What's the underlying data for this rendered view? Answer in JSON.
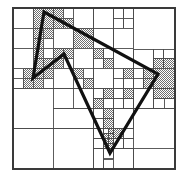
{
  "figure": {
    "name": "quadtree-polygon-decomposition",
    "title": "",
    "caption": "",
    "width": 188,
    "height": 179,
    "background_color": "#ffffff"
  },
  "frame": {
    "x": 13,
    "y": 8,
    "width": 162,
    "height": 161,
    "stroke_color": "#3a3a3a",
    "stroke_width": 1.2,
    "fill_color": "#ffffff"
  },
  "style": {
    "grid_line_color": "#4a4a4a",
    "grid_line_width": 0.9,
    "shaded_cell_color": "#b4b4b4",
    "shaded_cell_pattern": "checker-dither",
    "empty_cell_color": "#ffffff",
    "polygon_stroke_color": "#111111",
    "polygon_stroke_width": 3.2,
    "polygon_fill": "none"
  },
  "polygon": {
    "name": "input-polygon",
    "closed": true,
    "vertex_count": 5,
    "vertices": [
      {
        "label": "top",
        "x": 44,
        "y": 12
      },
      {
        "label": "right",
        "x": 158,
        "y": 74
      },
      {
        "label": "bottom",
        "x": 110,
        "y": 153
      },
      {
        "label": "middle-peak",
        "x": 64,
        "y": 54
      },
      {
        "label": "left",
        "x": 33,
        "y": 78
      }
    ],
    "points_attr": "44,12 158,74 110,153 64,54 33,78"
  },
  "quadtree": {
    "root_x": 13,
    "root_y": 8,
    "root_size": 161,
    "max_depth": 5,
    "cells": [
      {
        "x": 13,
        "y": 8,
        "w": 20.125,
        "h": 20.125,
        "shaded": false
      },
      {
        "x": 33.125,
        "y": 8,
        "w": 20.125,
        "h": 20.125,
        "shaded": true
      },
      {
        "x": 53.25,
        "y": 8,
        "w": 10.0625,
        "h": 10.0625,
        "shaded": true
      },
      {
        "x": 63.3125,
        "y": 8,
        "w": 10.0625,
        "h": 10.0625,
        "shaded": false
      },
      {
        "x": 53.25,
        "y": 18.0625,
        "w": 10.0625,
        "h": 10.0625,
        "shaded": true
      },
      {
        "x": 63.3125,
        "y": 18.0625,
        "w": 10.0625,
        "h": 10.0625,
        "shaded": true
      },
      {
        "x": 73.375,
        "y": 8,
        "w": 20.125,
        "h": 20.125,
        "shaded": false
      },
      {
        "x": 13,
        "y": 28.125,
        "w": 20.125,
        "h": 20.125,
        "shaded": false
      },
      {
        "x": 33.125,
        "y": 28.125,
        "w": 10.0625,
        "h": 10.0625,
        "shaded": true
      },
      {
        "x": 43.1875,
        "y": 28.125,
        "w": 10.0625,
        "h": 10.0625,
        "shaded": true
      },
      {
        "x": 33.125,
        "y": 38.1875,
        "w": 10.0625,
        "h": 10.0625,
        "shaded": true
      },
      {
        "x": 43.1875,
        "y": 38.1875,
        "w": 10.0625,
        "h": 10.0625,
        "shaded": false
      },
      {
        "x": 53.25,
        "y": 28.125,
        "w": 20.125,
        "h": 20.125,
        "shaded": false
      },
      {
        "x": 73.375,
        "y": 28.125,
        "w": 20.125,
        "h": 20.125,
        "shaded": true
      },
      {
        "x": 13,
        "y": 48.25,
        "w": 20.125,
        "h": 20.125,
        "shaded": false
      },
      {
        "x": 33.125,
        "y": 48.25,
        "w": 10.0625,
        "h": 10.0625,
        "shaded": true
      },
      {
        "x": 43.1875,
        "y": 48.25,
        "w": 10.0625,
        "h": 10.0625,
        "shaded": false
      },
      {
        "x": 33.125,
        "y": 58.3125,
        "w": 10.0625,
        "h": 10.0625,
        "shaded": true
      },
      {
        "x": 43.1875,
        "y": 58.3125,
        "w": 10.0625,
        "h": 10.0625,
        "shaded": true
      },
      {
        "x": 53.25,
        "y": 48.25,
        "w": 10.0625,
        "h": 10.0625,
        "shaded": true
      },
      {
        "x": 63.3125,
        "y": 48.25,
        "w": 10.0625,
        "h": 10.0625,
        "shaded": true
      },
      {
        "x": 53.25,
        "y": 58.3125,
        "w": 10.0625,
        "h": 10.0625,
        "shaded": true
      },
      {
        "x": 63.3125,
        "y": 58.3125,
        "w": 10.0625,
        "h": 10.0625,
        "shaded": false
      },
      {
        "x": 73.375,
        "y": 48.25,
        "w": 20.125,
        "h": 20.125,
        "shaded": false
      },
      {
        "x": 13,
        "y": 68.375,
        "w": 10.0625,
        "h": 10.0625,
        "shaded": false
      },
      {
        "x": 23.0625,
        "y": 68.375,
        "w": 10.0625,
        "h": 10.0625,
        "shaded": true
      },
      {
        "x": 13,
        "y": 78.4375,
        "w": 10.0625,
        "h": 10.0625,
        "shaded": false
      },
      {
        "x": 23.0625,
        "y": 78.4375,
        "w": 10.0625,
        "h": 10.0625,
        "shaded": true
      },
      {
        "x": 33.125,
        "y": 68.375,
        "w": 10.0625,
        "h": 10.0625,
        "shaded": true
      },
      {
        "x": 43.1875,
        "y": 68.375,
        "w": 10.0625,
        "h": 10.0625,
        "shaded": true
      },
      {
        "x": 33.125,
        "y": 78.4375,
        "w": 10.0625,
        "h": 10.0625,
        "shaded": true
      },
      {
        "x": 43.1875,
        "y": 78.4375,
        "w": 10.0625,
        "h": 10.0625,
        "shaded": false
      },
      {
        "x": 53.25,
        "y": 68.375,
        "w": 20.125,
        "h": 20.125,
        "shaded": false
      },
      {
        "x": 73.375,
        "y": 68.375,
        "w": 10.0625,
        "h": 10.0625,
        "shaded": true
      },
      {
        "x": 83.4375,
        "y": 68.375,
        "w": 10.0625,
        "h": 10.0625,
        "shaded": false
      },
      {
        "x": 73.375,
        "y": 78.4375,
        "w": 10.0625,
        "h": 10.0625,
        "shaded": false
      },
      {
        "x": 83.4375,
        "y": 78.4375,
        "w": 10.0625,
        "h": 10.0625,
        "shaded": true
      },
      {
        "x": 93.5,
        "y": 8,
        "w": 20.125,
        "h": 20.125,
        "shaded": false
      },
      {
        "x": 113.625,
        "y": 8,
        "w": 10.0625,
        "h": 10.0625,
        "shaded": false
      },
      {
        "x": 123.6875,
        "y": 8,
        "w": 10.0625,
        "h": 10.0625,
        "shaded": false
      },
      {
        "x": 113.625,
        "y": 18.0625,
        "w": 10.0625,
        "h": 10.0625,
        "shaded": false
      },
      {
        "x": 123.6875,
        "y": 18.0625,
        "w": 10.0625,
        "h": 10.0625,
        "shaded": false
      },
      {
        "x": 133.75,
        "y": 8,
        "w": 41.25,
        "h": 41.25,
        "shaded": false
      },
      {
        "x": 93.5,
        "y": 28.125,
        "w": 20.125,
        "h": 20.125,
        "shaded": false
      },
      {
        "x": 113.625,
        "y": 28.125,
        "w": 20.125,
        "h": 20.125,
        "shaded": false
      },
      {
        "x": 93.5,
        "y": 48.25,
        "w": 10.0625,
        "h": 10.0625,
        "shaded": true
      },
      {
        "x": 103.5625,
        "y": 48.25,
        "w": 10.0625,
        "h": 10.0625,
        "shaded": false
      },
      {
        "x": 93.5,
        "y": 58.3125,
        "w": 10.0625,
        "h": 10.0625,
        "shaded": false
      },
      {
        "x": 103.5625,
        "y": 58.3125,
        "w": 10.0625,
        "h": 10.0625,
        "shaded": true
      },
      {
        "x": 113.625,
        "y": 48.25,
        "w": 20.125,
        "h": 20.125,
        "shaded": false
      },
      {
        "x": 133.75,
        "y": 49.25,
        "w": 20.125,
        "h": 19.125,
        "shaded": false
      },
      {
        "x": 153.875,
        "y": 49.25,
        "w": 10.0625,
        "h": 9.5625,
        "shaded": false
      },
      {
        "x": 163.9375,
        "y": 49.25,
        "w": 11.0625,
        "h": 9.5625,
        "shaded": false
      },
      {
        "x": 153.875,
        "y": 58.8125,
        "w": 10.0625,
        "h": 9.5625,
        "shaded": true
      },
      {
        "x": 163.9375,
        "y": 58.8125,
        "w": 11.0625,
        "h": 9.5625,
        "shaded": true
      },
      {
        "x": 93.5,
        "y": 68.375,
        "w": 20.125,
        "h": 20.125,
        "shaded": false
      },
      {
        "x": 113.625,
        "y": 68.375,
        "w": 10.0625,
        "h": 10.0625,
        "shaded": false
      },
      {
        "x": 123.6875,
        "y": 68.375,
        "w": 10.0625,
        "h": 10.0625,
        "shaded": true
      },
      {
        "x": 113.625,
        "y": 78.4375,
        "w": 10.0625,
        "h": 10.0625,
        "shaded": false
      },
      {
        "x": 123.6875,
        "y": 78.4375,
        "w": 10.0625,
        "h": 10.0625,
        "shaded": false
      },
      {
        "x": 133.75,
        "y": 68.375,
        "w": 10.0625,
        "h": 10.0625,
        "shaded": false
      },
      {
        "x": 143.8125,
        "y": 68.375,
        "w": 10.0625,
        "h": 10.0625,
        "shaded": true
      },
      {
        "x": 133.75,
        "y": 78.4375,
        "w": 10.0625,
        "h": 10.0625,
        "shaded": false
      },
      {
        "x": 143.8125,
        "y": 78.4375,
        "w": 10.0625,
        "h": 10.0625,
        "shaded": true
      },
      {
        "x": 153.875,
        "y": 68.375,
        "w": 21.125,
        "h": 20.125,
        "shaded": true
      },
      {
        "x": 13,
        "y": 88.5,
        "w": 40.25,
        "h": 40.25,
        "shaded": false
      },
      {
        "x": 53.25,
        "y": 88.5,
        "w": 20.125,
        "h": 20.125,
        "shaded": false
      },
      {
        "x": 73.375,
        "y": 88.5,
        "w": 20.125,
        "h": 20.125,
        "shaded": false
      },
      {
        "x": 53.25,
        "y": 108.625,
        "w": 40.25,
        "h": 20.125,
        "shaded": false
      },
      {
        "x": 13,
        "y": 128.75,
        "w": 40.25,
        "h": 40.25,
        "shaded": false
      },
      {
        "x": 53.25,
        "y": 128.75,
        "w": 40.25,
        "h": 40.25,
        "shaded": false
      },
      {
        "x": 93.5,
        "y": 88.5,
        "w": 10.0625,
        "h": 10.0625,
        "shaded": false
      },
      {
        "x": 103.5625,
        "y": 88.5,
        "w": 10.0625,
        "h": 10.0625,
        "shaded": true
      },
      {
        "x": 93.5,
        "y": 98.5625,
        "w": 10.0625,
        "h": 10.0625,
        "shaded": true
      },
      {
        "x": 103.5625,
        "y": 98.5625,
        "w": 10.0625,
        "h": 10.0625,
        "shaded": false
      },
      {
        "x": 113.625,
        "y": 88.5,
        "w": 10.0625,
        "h": 10.0625,
        "shaded": false
      },
      {
        "x": 123.6875,
        "y": 88.5,
        "w": 10.0625,
        "h": 10.0625,
        "shaded": true
      },
      {
        "x": 113.625,
        "y": 98.5625,
        "w": 10.0625,
        "h": 10.0625,
        "shaded": false
      },
      {
        "x": 123.6875,
        "y": 98.5625,
        "w": 10.0625,
        "h": 10.0625,
        "shaded": false
      },
      {
        "x": 133.75,
        "y": 88.5,
        "w": 20.125,
        "h": 20.125,
        "shaded": false
      },
      {
        "x": 153.875,
        "y": 88.5,
        "w": 21.125,
        "h": 10.0625,
        "shaded": true
      },
      {
        "x": 153.875,
        "y": 98.5625,
        "w": 10.5625,
        "h": 10.0625,
        "shaded": false
      },
      {
        "x": 164.4375,
        "y": 98.5625,
        "w": 10.5625,
        "h": 10.0625,
        "shaded": false
      },
      {
        "x": 93.5,
        "y": 108.625,
        "w": 10.0625,
        "h": 10.0625,
        "shaded": false
      },
      {
        "x": 103.5625,
        "y": 108.625,
        "w": 10.0625,
        "h": 10.0625,
        "shaded": true
      },
      {
        "x": 93.5,
        "y": 118.6875,
        "w": 10.0625,
        "h": 10.0625,
        "shaded": false
      },
      {
        "x": 103.5625,
        "y": 118.6875,
        "w": 10.0625,
        "h": 10.0625,
        "shaded": true
      },
      {
        "x": 113.625,
        "y": 108.625,
        "w": 20.125,
        "h": 20.125,
        "shaded": false
      },
      {
        "x": 133.75,
        "y": 108.625,
        "w": 41.25,
        "h": 41.25,
        "shaded": false
      },
      {
        "x": 53.25,
        "y": 88.5,
        "w": 0,
        "h": 0,
        "shaded": false
      },
      {
        "x": 93.5,
        "y": 128.75,
        "w": 10.0625,
        "h": 10.0625,
        "shaded": false
      },
      {
        "x": 103.5625,
        "y": 128.75,
        "w": 5.03125,
        "h": 5.03125,
        "shaded": false
      },
      {
        "x": 108.59375,
        "y": 128.75,
        "w": 5.03125,
        "h": 5.03125,
        "shaded": true
      },
      {
        "x": 103.5625,
        "y": 133.78125,
        "w": 5.03125,
        "h": 5.03125,
        "shaded": true
      },
      {
        "x": 108.59375,
        "y": 133.78125,
        "w": 5.03125,
        "h": 5.03125,
        "shaded": true
      },
      {
        "x": 93.5,
        "y": 138.8125,
        "w": 10.0625,
        "h": 10.0625,
        "shaded": false
      },
      {
        "x": 103.5625,
        "y": 138.8125,
        "w": 5.03125,
        "h": 5.03125,
        "shaded": true
      },
      {
        "x": 108.59375,
        "y": 138.8125,
        "w": 5.03125,
        "h": 5.03125,
        "shaded": true
      },
      {
        "x": 103.5625,
        "y": 143.84375,
        "w": 5.03125,
        "h": 5.03125,
        "shaded": true
      },
      {
        "x": 108.59375,
        "y": 143.84375,
        "w": 5.03125,
        "h": 5.03125,
        "shaded": true
      },
      {
        "x": 113.625,
        "y": 128.75,
        "w": 10.0625,
        "h": 10.0625,
        "shaded": true
      },
      {
        "x": 123.6875,
        "y": 128.75,
        "w": 10.0625,
        "h": 10.0625,
        "shaded": false
      },
      {
        "x": 113.625,
        "y": 138.8125,
        "w": 10.0625,
        "h": 10.0625,
        "shaded": false
      },
      {
        "x": 123.6875,
        "y": 138.8125,
        "w": 10.0625,
        "h": 10.0625,
        "shaded": false
      },
      {
        "x": 93.5,
        "y": 148.875,
        "w": 10.0625,
        "h": 20.125,
        "shaded": false
      },
      {
        "x": 103.5625,
        "y": 148.875,
        "w": 10.0625,
        "h": 10.0625,
        "shaded": false
      },
      {
        "x": 113.625,
        "y": 148.875,
        "w": 20.125,
        "h": 20.125,
        "shaded": false
      },
      {
        "x": 103.5625,
        "y": 159,
        "w": 10.0625,
        "h": 10,
        "shaded": false
      },
      {
        "x": 133.75,
        "y": 148.875,
        "w": 41.25,
        "h": 20.125,
        "shaded": false
      }
    ]
  }
}
